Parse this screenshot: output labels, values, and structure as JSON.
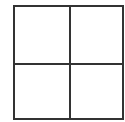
{
  "diagram": {
    "type": "grid",
    "rows": 2,
    "columns": 2,
    "line_color": "#333333",
    "background_color": "#ffffff",
    "cells": [
      {
        "row": 0,
        "col": 0,
        "label": ""
      },
      {
        "row": 0,
        "col": 1,
        "label": ""
      },
      {
        "row": 1,
        "col": 0,
        "label": ""
      },
      {
        "row": 1,
        "col": 1,
        "label": ""
      }
    ]
  }
}
